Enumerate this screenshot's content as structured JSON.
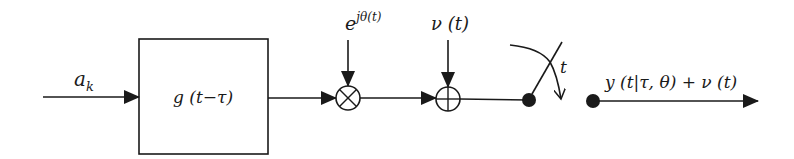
{
  "diagram": {
    "type": "signal-flow block diagram",
    "colors": {
      "stroke": "#1a1a1a",
      "background": "#ffffff"
    },
    "input": {
      "label_base": "a",
      "label_sub": "k"
    },
    "filter_block": {
      "label": "g (t−τ)"
    },
    "multiplier": {
      "symbol": "⊗",
      "input_label_base": "e",
      "input_label_sup": "jθ(t)"
    },
    "adder": {
      "symbol": "⊕",
      "input_label": "ν (t)"
    },
    "sampler": {
      "label": "t"
    },
    "output": {
      "label": "y (t|τ, θ) + ν (t)"
    }
  }
}
